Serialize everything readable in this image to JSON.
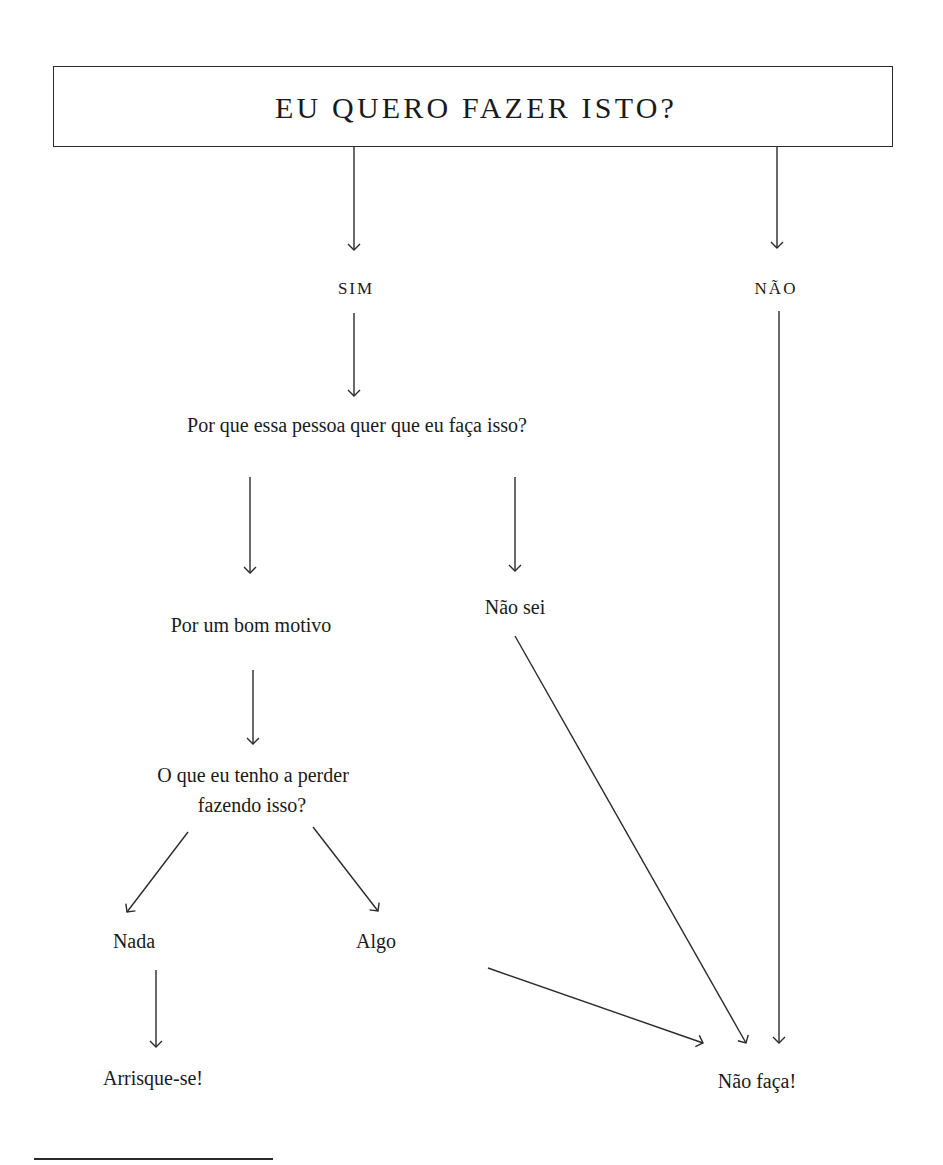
{
  "diagram": {
    "type": "flowchart",
    "title": "EU QUERO FAZER ISTO?",
    "nodes": {
      "yes": "SIM",
      "no": "NÃO",
      "why_question": "Por que essa pessoa quer que eu faça isso?",
      "good_reason": "Por um bom motivo",
      "dont_know": "Não sei",
      "lose_question_line1": "O que eu tenho a perder",
      "lose_question_line2": "fazendo isso?",
      "nothing": "Nada",
      "something": "Algo",
      "take_risk": "Arrisque-se!",
      "dont_do_it": "Não faça!"
    },
    "edges": [
      {
        "from": "title",
        "to": "yes"
      },
      {
        "from": "title",
        "to": "no"
      },
      {
        "from": "yes",
        "to": "why_question"
      },
      {
        "from": "why_question",
        "to": "good_reason"
      },
      {
        "from": "why_question",
        "to": "dont_know"
      },
      {
        "from": "good_reason",
        "to": "lose_question"
      },
      {
        "from": "lose_question",
        "to": "nothing"
      },
      {
        "from": "lose_question",
        "to": "something"
      },
      {
        "from": "nothing",
        "to": "take_risk"
      },
      {
        "from": "something",
        "to": "dont_do_it"
      },
      {
        "from": "dont_know",
        "to": "dont_do_it"
      },
      {
        "from": "no",
        "to": "dont_do_it"
      }
    ],
    "colors": {
      "ink": "#1a1a1a",
      "line": "#2a2a2a",
      "background": "#ffffff"
    }
  }
}
